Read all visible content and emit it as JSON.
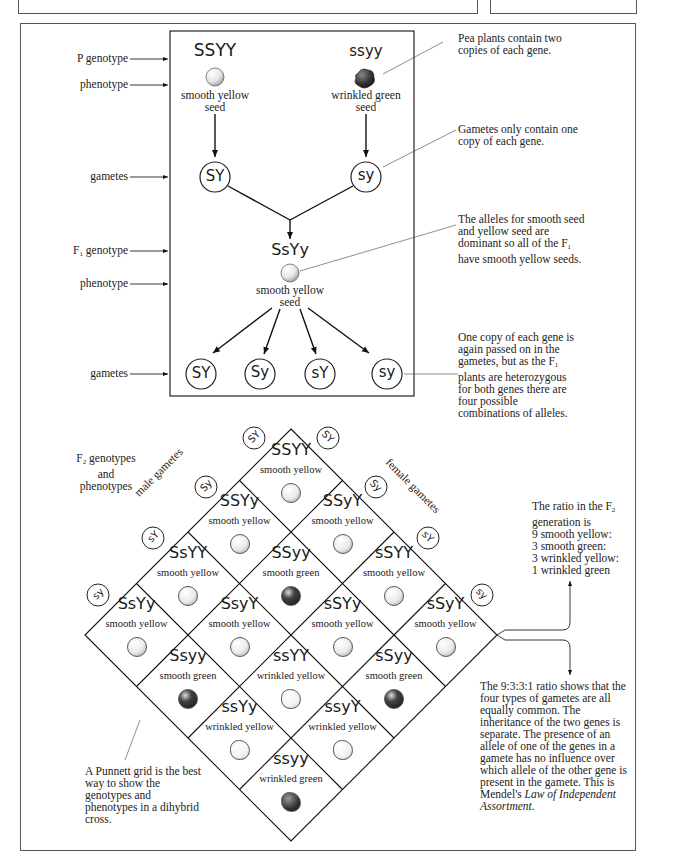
{
  "left_labels": {
    "p_genotype": "P genotype",
    "phenotype_1": "phenotype",
    "gametes_1": "gametes",
    "f1_genotype_prefix": "F",
    "f1_genotype_sub": "1",
    "f1_genotype_suffix": " genotype",
    "phenotype_2": "phenotype",
    "gametes_2": "gametes"
  },
  "parents": {
    "left": {
      "genotype": "SSYY",
      "phenotype_line1": "smooth yellow",
      "phenotype_line2": "seed",
      "gamete": "SY"
    },
    "right": {
      "genotype": "ssyy",
      "phenotype_line1": "wrinkled green",
      "phenotype_line2": "seed",
      "gamete": "sy"
    }
  },
  "f1": {
    "genotype": "SsYy",
    "phenotype_line1": "smooth yellow",
    "phenotype_line2": "seed",
    "gametes": [
      "SY",
      "Sy",
      "sY",
      "sy"
    ]
  },
  "notes": {
    "two_copies": "Pea plants contain two copies of each gene.",
    "one_copy": "Gametes only contain one copy of each gene.",
    "dominant_1": "The alleles for smooth seed and yellow seed are dominant so all of the F",
    "dominant_sub": "1",
    "dominant_2": " have smooth yellow seeds.",
    "again_1": "One copy of each gene is again passed on in the gametes, but as the F",
    "again_sub": "1",
    "again_2": " plants are heterozygous for both genes there are four possible combinations of alleles.",
    "ratio_1": "The ratio in the F",
    "ratio_sub": "2",
    "ratio_2": " generation is",
    "ratio_lines": [
      "9 smooth yellow:",
      "3 smooth green:",
      "3 wrinkled yellow:",
      "1 wrinkled green"
    ],
    "independent_1": "The 9:3:3:1 ratio shows that the four types of gametes are all equally common. The inheritance of the two genes is separate. The presence of an allele of one of the genes in a gamete has no influence over which allele of the other gene is present in the gamete. This is Mendel's ",
    "independent_italic": "Law of Independent Assortment",
    "independent_end": ".",
    "punnett": "A Punnett grid is the best way to show the genotypes and phenotypes in a dihybrid cross."
  },
  "f2_header": {
    "prefix": "F",
    "sub": "2",
    "line1_suffix": " genotypes",
    "line2": "and",
    "line3": "phenotypes"
  },
  "gamete_labels": {
    "male": "male gametes",
    "female": "female gametes"
  },
  "male_gametes": [
    "SY",
    "Sy",
    "sY",
    "sy"
  ],
  "female_gametes": [
    "SY",
    "Sy",
    "sY",
    "sy"
  ],
  "grid": [
    {
      "genotype": "SSYY",
      "phenotype": "smooth yellow",
      "seed": "smooth-yellow"
    },
    {
      "genotype": "SSYy",
      "phenotype": "smooth yellow",
      "seed": "smooth-yellow"
    },
    {
      "genotype": "SSyY",
      "phenotype": "smooth yellow",
      "seed": "smooth-yellow"
    },
    {
      "genotype": "SsYY",
      "phenotype": "smooth yellow",
      "seed": "smooth-yellow"
    },
    {
      "genotype": "SSyy",
      "phenotype": "smooth green",
      "seed": "smooth-green"
    },
    {
      "genotype": "sSYY",
      "phenotype": "smooth yellow",
      "seed": "smooth-yellow"
    },
    {
      "genotype": "SsYy",
      "phenotype": "smooth yellow",
      "seed": "smooth-yellow"
    },
    {
      "genotype": "SsyY",
      "phenotype": "smooth yellow",
      "seed": "smooth-yellow"
    },
    {
      "genotype": "sSYy",
      "phenotype": "smooth yellow",
      "seed": "smooth-yellow"
    },
    {
      "genotype": "sSyY",
      "phenotype": "smooth yellow",
      "seed": "smooth-yellow"
    },
    {
      "genotype": "Ssyy",
      "phenotype": "smooth green",
      "seed": "smooth-green"
    },
    {
      "genotype": "ssYY",
      "phenotype": "wrinkled yellow",
      "seed": "wrinkled-yellow"
    },
    {
      "genotype": "sSyy",
      "phenotype": "smooth green",
      "seed": "smooth-green"
    },
    {
      "genotype": "ssYy",
      "phenotype": "wrinkled yellow",
      "seed": "wrinkled-yellow"
    },
    {
      "genotype": "ssyY",
      "phenotype": "wrinkled yellow",
      "seed": "wrinkled-yellow"
    },
    {
      "genotype": "ssyy",
      "phenotype": "wrinkled green",
      "seed": "wrinkled-green"
    }
  ]
}
